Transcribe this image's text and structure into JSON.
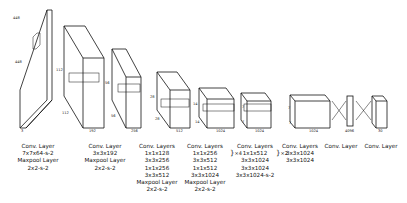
{
  "diagram": {
    "input": {
      "width": "448",
      "height": "448",
      "channels": "3",
      "kernel": "7",
      "kernel2": "7"
    },
    "blocks": [
      {
        "id": "b1",
        "depth_label": "192",
        "h_label": "112",
        "w_label": "112",
        "kernel": "3",
        "kernel2": "3",
        "layers": [
          "Conv. Layer",
          "7x7x64-s-2",
          "Maxpool Layer",
          "2x2-s-2"
        ]
      },
      {
        "id": "b2",
        "depth_label": "256",
        "h_label": "56",
        "w_label": "56",
        "kernel": "3",
        "kernel2": "3",
        "layers": [
          "Conv. Layer",
          "3x3x192",
          "Maxpool Layer",
          "2x2-s-2"
        ]
      },
      {
        "id": "b3",
        "depth_label": "512",
        "h_label": "28",
        "w_label": "28",
        "kernel": "3",
        "kernel2": "3",
        "layers": [
          "Conv. Layers",
          "1x1x128",
          "3x3x256",
          "1x1x256",
          "3x3x512",
          "Maxpool Layer",
          "2x2-s-2"
        ]
      },
      {
        "id": "b4",
        "depth_label": "1024",
        "h_label": "14",
        "w_label": "14",
        "kernel": "3",
        "kernel2": "3",
        "layers": [
          "Conv. Layers",
          "1x1x256",
          "3x3x512",
          "1x1x512",
          "3x3x1024",
          "Maxpool Layer",
          "2x2-s-2"
        ],
        "repeat": "×4"
      },
      {
        "id": "b5",
        "depth_label": "1024",
        "h_label": "7",
        "w_label": "7",
        "kernel": "3",
        "kernel2": "3",
        "layers": [
          "Conv. Layers",
          "1x1x512",
          "3x3x1024",
          "3x3x1024",
          "3x3x1024-s-2"
        ],
        "repeat": "×2"
      },
      {
        "id": "b6",
        "depth_label": "1024",
        "h_label": "7",
        "w_label": "7",
        "layers": [
          "Conv. Layers",
          "3x3x1024",
          "3x3x1024"
        ]
      },
      {
        "id": "fc1",
        "depth_label": "4096",
        "layers": [
          "Conv. Layer"
        ]
      },
      {
        "id": "out",
        "depth_label": "30",
        "h_label": "7",
        "w_label": "7",
        "layers": [
          "Conv. Layer"
        ]
      }
    ]
  }
}
